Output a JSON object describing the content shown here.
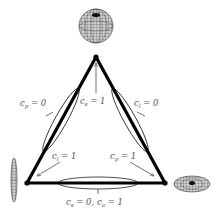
{
  "diagram": {
    "type": "barycentric-triangle",
    "vertices": [
      {
        "id": "top",
        "shape": "sphere",
        "label": "c_s = 1"
      },
      {
        "id": "bottom-left",
        "shape": "linear-ellipsoid",
        "label": "c_l = 1"
      },
      {
        "id": "bottom-right",
        "shape": "planar-disc",
        "label": "c_p = 1"
      }
    ],
    "edges": [
      {
        "id": "left",
        "label": "c_p = 0"
      },
      {
        "id": "right",
        "label": "c_l = 0"
      },
      {
        "id": "bottom",
        "label": "c_s = 0, c_a = 1"
      }
    ]
  },
  "labels": {
    "cp0": {
      "var": "c",
      "sub": "p",
      "rest": " = 0"
    },
    "cs1": {
      "var": "c",
      "sub": "s",
      "rest": " = 1"
    },
    "cl0": {
      "var": "c",
      "sub": "l",
      "rest": " = 0"
    },
    "cl1": {
      "var": "c",
      "sub": "l",
      "rest": " = 1"
    },
    "cp1": {
      "var": "c",
      "sub": "p",
      "rest": " = 1"
    },
    "bottom": {
      "var1": "c",
      "sub1": "s",
      "mid": " = 0, ",
      "var2": "c",
      "sub2": "a",
      "rest": " = 1"
    }
  },
  "colors": {
    "triangle": "#000000",
    "label": "#555555",
    "mesh": "#333333"
  }
}
